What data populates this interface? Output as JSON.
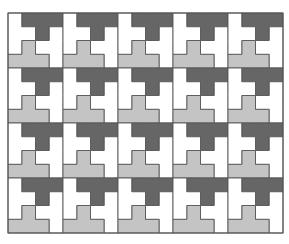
{
  "figure": {
    "colors": {
      "background": "#ffffff",
      "dark": "#666666",
      "light": "#c4c4c4",
      "white": "#ffffff",
      "outline": "#555555"
    },
    "grid": {
      "origin_x": 8,
      "origin_y": 13,
      "tile_size": 55,
      "columns": 5,
      "rows": 4,
      "cells_per_tile": 4
    },
    "tile_pieces": [
      {
        "name": "dark-t-piece",
        "fill": "dark",
        "cells": [
          [
            1,
            0
          ],
          [
            2,
            0
          ],
          [
            3,
            0
          ],
          [
            2,
            1
          ]
        ]
      },
      {
        "name": "light-t-piece",
        "fill": "light",
        "cells": [
          [
            1,
            2
          ],
          [
            0,
            3
          ],
          [
            1,
            3
          ],
          [
            2,
            3
          ]
        ]
      },
      {
        "name": "white-left-t-piece",
        "fill": "white",
        "cells": [
          [
            0,
            0
          ],
          [
            0,
            1
          ],
          [
            1,
            1
          ],
          [
            0,
            2
          ]
        ]
      },
      {
        "name": "white-right-t-piece",
        "fill": "white",
        "cells": [
          [
            3,
            1
          ],
          [
            2,
            2
          ],
          [
            3,
            2
          ],
          [
            3,
            3
          ]
        ]
      }
    ]
  }
}
